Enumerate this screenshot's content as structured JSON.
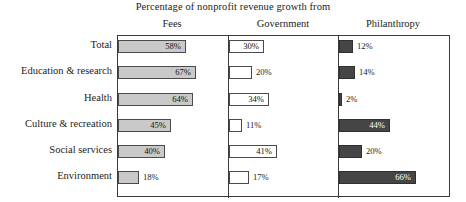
{
  "chart_data": {
    "type": "bar",
    "title": "Percentage of nonprofit revenue growth from",
    "xlabel": "",
    "ylabel": "",
    "orientation": "horizontal",
    "grid": false,
    "legend": "none",
    "panel_headers": [
      "Fees",
      "Government",
      "Philanthropy"
    ],
    "categories": [
      "Total",
      "Education & research",
      "Health",
      "Culture & recreation",
      "Social services",
      "Environment"
    ],
    "series": [
      {
        "name": "Fees",
        "values": [
          58,
          67,
          64,
          45,
          40,
          18
        ],
        "labels": [
          "58%",
          "67%",
          "64%",
          "45%",
          "40%",
          "18%"
        ],
        "fill": "#c9c9c9"
      },
      {
        "name": "Government",
        "values": [
          30,
          20,
          34,
          11,
          41,
          17
        ],
        "labels": [
          "30%",
          "20%",
          "34%",
          "11%",
          "41%",
          "17%"
        ],
        "fill": "#ffffff"
      },
      {
        "name": "Philanthropy",
        "values": [
          12,
          14,
          2,
          44,
          20,
          66
        ],
        "labels": [
          "12%",
          "14%",
          "2%",
          "44%",
          "20%",
          "66%"
        ],
        "fill": "#454545"
      }
    ],
    "xlim": [
      0,
      100
    ],
    "units": "percent"
  },
  "layout": {
    "frame_color": "#3a3a3a",
    "panel_x": [
      117,
      228,
      338
    ],
    "panel_width": 110,
    "px_per_percent": 1.17,
    "row_tops": [
      40,
      66,
      93,
      119,
      145,
      171
    ],
    "bar_height": 13
  }
}
